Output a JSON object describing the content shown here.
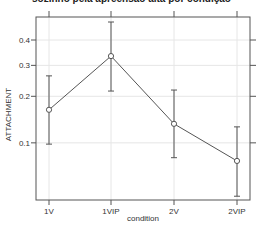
{
  "chart_data": {
    "type": "line",
    "title": "sozinho pela apreensão alta por condição",
    "xlabel": "condition",
    "ylabel": "ATTACHMENT",
    "categories": [
      "1V",
      "1VIP",
      "2V",
      "2VIP"
    ],
    "series": [
      {
        "name": "ATTACHMENT",
        "values": [
          0.165,
          0.335,
          0.134,
          0.075
        ],
        "error_upper": [
          0.263,
          0.477,
          0.218,
          0.128
        ],
        "error_lower": [
          0.098,
          0.215,
          0.079,
          0.042
        ]
      }
    ],
    "y_scale": "logit",
    "yticks": [
      0.1,
      0.2,
      0.3,
      0.4
    ],
    "ytick_labels": [
      "0.1",
      "0.2",
      "0.3",
      "0.4"
    ],
    "ylim": [
      0.04,
      0.49
    ],
    "grid": true,
    "legend": "none"
  },
  "colors": {
    "line": "#555555",
    "frame": "#555555",
    "grid": "#e6e6e6",
    "marker_fill": "#ffffff"
  }
}
